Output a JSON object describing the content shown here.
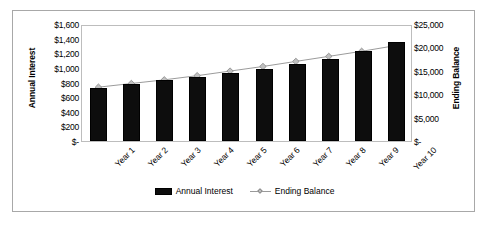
{
  "chart_data": {
    "type": "bar",
    "title": "",
    "subtitle": "",
    "xlabel": "",
    "ylabel": "Annual Interest",
    "y2label": "Ending Balance",
    "categories": [
      "Year 1",
      "Year 2",
      "Year 3",
      "Year 4",
      "Year 5",
      "Year 6",
      "Year 7",
      "Year 8",
      "Year 9",
      "Year 10"
    ],
    "series": [
      {
        "name": "Annual Interest",
        "type": "bar",
        "axis": "left",
        "color": "#0d0d0d",
        "values": [
          720,
          780,
          830,
          880,
          935,
          990,
          1055,
          1120,
          1230,
          1350
        ]
      },
      {
        "name": "Ending Balance",
        "type": "line",
        "axis": "right",
        "color": "#9a9a9a",
        "marker": "diamond",
        "marker_color": "#c0c0c0",
        "values": [
          11700,
          12500,
          13300,
          14200,
          15200,
          16200,
          17300,
          18400,
          19500,
          20700
        ]
      }
    ],
    "ylim": [
      0,
      1600
    ],
    "y2lim": [
      0,
      25000
    ],
    "yticks": [
      0,
      200,
      400,
      600,
      800,
      1000,
      1200,
      1400,
      1600
    ],
    "ytick_labels": [
      "$-",
      "$200",
      "$400",
      "$600",
      "$800",
      "$1,000",
      "$1,200",
      "$1,400",
      "$1,600"
    ],
    "y2ticks": [
      0,
      5000,
      10000,
      15000,
      20000,
      25000
    ],
    "y2tick_labels": [
      "$-",
      "$5,000",
      "$10,000",
      "$15,000",
      "$20,000",
      "$25,000"
    ],
    "grid": false,
    "legend_position": "bottom",
    "legend": [
      "Annual Interest",
      "Ending Balance"
    ],
    "plot_border_color": "#bdbdbd",
    "frame_border_color": "#a8a8a8",
    "background": "#ffffff"
  }
}
